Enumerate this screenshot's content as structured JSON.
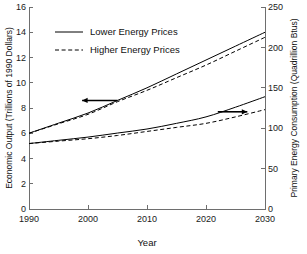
{
  "figure": {
    "title": "",
    "background_color": "#ffffff",
    "line_color": "#000000",
    "axis_color": "#6e6e6e"
  },
  "chart_data": {
    "type": "line",
    "title": "",
    "subtitle": "",
    "xlabel": "Year",
    "ylabel": "Economic Output (Trillions of 1990 Dollars)",
    "y2label": "Primary Energy Consumption (Quadrillion Btus)",
    "xlim": [
      1990,
      2030
    ],
    "ylim": [
      0,
      16
    ],
    "y2lim": [
      0,
      250
    ],
    "xticks": [
      1990,
      2000,
      2010,
      2020,
      2030
    ],
    "xtick_labels": [
      "1990",
      "2000",
      "2010",
      "2020",
      "2030"
    ],
    "yticks": [
      0,
      2,
      4,
      6,
      8,
      10,
      12,
      14,
      16
    ],
    "ytick_labels": [
      "0",
      "2",
      "4",
      "6",
      "8",
      "10",
      "12",
      "14",
      "16"
    ],
    "y2ticks": [
      0,
      50,
      100,
      150,
      200,
      250
    ],
    "y2tick_labels": [
      "0",
      "50",
      "100",
      "150",
      "200",
      "250"
    ],
    "grid": false,
    "legend_position": "upper-left-inside",
    "x": [
      1990,
      1995,
      2000,
      2005,
      2010,
      2015,
      2020,
      2025,
      2030
    ],
    "series": [
      {
        "name": "Lower Energy Prices",
        "axis": "left",
        "style": "solid",
        "units": "Trillions of 1990 Dollars",
        "values": [
          6.0,
          6.8,
          7.6,
          8.6,
          9.6,
          10.7,
          11.8,
          12.9,
          14.0
        ]
      },
      {
        "name": "Higher Energy Prices",
        "axis": "left",
        "style": "dashed",
        "units": "Trillions of 1990 Dollars",
        "values": [
          6.0,
          6.75,
          7.5,
          8.5,
          9.4,
          10.4,
          11.4,
          12.5,
          13.6
        ]
      },
      {
        "name": "Lower Energy Prices",
        "axis": "right",
        "style": "solid",
        "units": "Quadrillion Btus",
        "values": [
          81,
          85,
          89,
          94,
          99,
          106,
          114,
          126,
          139
        ]
      },
      {
        "name": "Higher Energy Prices",
        "axis": "right",
        "style": "dashed",
        "units": "Quadrillion Btus",
        "values": [
          81,
          84,
          87,
          91,
          96,
          101,
          106,
          114,
          123
        ]
      }
    ],
    "legend": [
      {
        "label": "Lower Energy Prices",
        "style": "solid"
      },
      {
        "label": "Higher Energy Prices",
        "style": "dashed"
      }
    ],
    "annotations": [
      {
        "name": "left-axis-pointer",
        "text": "",
        "direction": "left",
        "x_start": 2005,
        "x_end": 1999,
        "y_value": 8.6,
        "axis": "left",
        "describes": "upper pair of curves reads on the left axis"
      },
      {
        "name": "right-axis-pointer",
        "text": "",
        "direction": "right",
        "x_start": 2022,
        "x_end": 2027,
        "y_value": 7.7,
        "axis": "left",
        "describes": "lower pair of curves reads on the right axis"
      }
    ]
  }
}
